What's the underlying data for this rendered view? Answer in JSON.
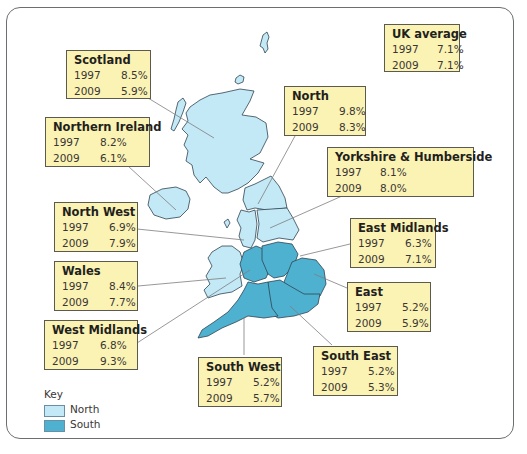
{
  "colors": {
    "north": "#c3e8f6",
    "south": "#4fb1d0",
    "box_fill": "#fbf3b3",
    "box_border": "#5c5a4e",
    "leader": "#7d7d7d",
    "outline": "#2e4452"
  },
  "uk_average": {
    "title": "UK average",
    "rows": [
      {
        "year": "1997",
        "value": "7.1%"
      },
      {
        "year": "2009",
        "value": "7.1%"
      }
    ]
  },
  "regions": {
    "scotland": {
      "title": "Scotland",
      "group": "North",
      "rows": [
        {
          "year": "1997",
          "value": "8.5%"
        },
        {
          "year": "2009",
          "value": "5.9%"
        }
      ]
    },
    "northern_ireland": {
      "title": "Northern Ireland",
      "group": "North",
      "rows": [
        {
          "year": "1997",
          "value": "8.2%"
        },
        {
          "year": "2009",
          "value": "6.1%"
        }
      ]
    },
    "north_west": {
      "title": "North West",
      "group": "North",
      "rows": [
        {
          "year": "1997",
          "value": "6.9%"
        },
        {
          "year": "2009",
          "value": "7.9%"
        }
      ]
    },
    "wales": {
      "title": "Wales",
      "group": "North",
      "rows": [
        {
          "year": "1997",
          "value": "8.4%"
        },
        {
          "year": "2009",
          "value": "7.7%"
        }
      ]
    },
    "west_midlands": {
      "title": "West Midlands",
      "group": "South",
      "rows": [
        {
          "year": "1997",
          "value": "6.8%"
        },
        {
          "year": "2009",
          "value": "9.3%"
        }
      ]
    },
    "north": {
      "title": "North",
      "group": "North",
      "rows": [
        {
          "year": "1997",
          "value": "9.8%"
        },
        {
          "year": "2009",
          "value": "8.3%"
        }
      ]
    },
    "yorkshire": {
      "title": "Yorkshire & Humberside",
      "group": "North",
      "rows": [
        {
          "year": "1997",
          "value": "8.1%"
        },
        {
          "year": "2009",
          "value": "8.0%"
        }
      ]
    },
    "east_midlands": {
      "title": "East Midlands",
      "group": "South",
      "rows": [
        {
          "year": "1997",
          "value": "6.3%"
        },
        {
          "year": "2009",
          "value": "7.1%"
        }
      ]
    },
    "east": {
      "title": "East",
      "group": "South",
      "rows": [
        {
          "year": "1997",
          "value": "5.2%"
        },
        {
          "year": "2009",
          "value": "5.9%"
        }
      ]
    },
    "south_east": {
      "title": "South East",
      "group": "South",
      "rows": [
        {
          "year": "1997",
          "value": "5.2%"
        },
        {
          "year": "2009",
          "value": "5.3%"
        }
      ]
    },
    "south_west": {
      "title": "South West",
      "group": "South",
      "rows": [
        {
          "year": "1997",
          "value": "5.2%"
        },
        {
          "year": "2009",
          "value": "5.7%"
        }
      ]
    }
  },
  "key": {
    "title": "Key",
    "items": [
      {
        "label": "North",
        "color": "#c3e8f6"
      },
      {
        "label": "South",
        "color": "#4fb1d0"
      }
    ]
  }
}
